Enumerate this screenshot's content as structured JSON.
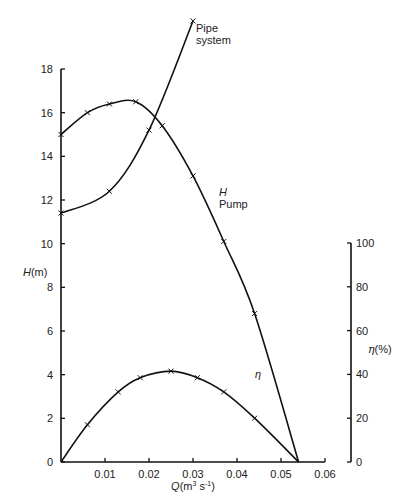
{
  "chart_data": {
    "type": "line",
    "title": "",
    "xlabel": "Q(m³ s⁻¹)",
    "ylabel": "H(m)",
    "y2label": "η(%)",
    "xlim": [
      0,
      0.06
    ],
    "ylim": [
      0,
      18
    ],
    "y2lim": [
      0,
      100
    ],
    "x_ticks": [
      "0.01",
      "0.02",
      "0.03",
      "0.04",
      "0.05",
      "0.06"
    ],
    "y_ticks": [
      "0",
      "2",
      "4",
      "6",
      "8",
      "10",
      "12",
      "14",
      "16",
      "18"
    ],
    "y2_ticks": [
      "0",
      "20",
      "40",
      "60",
      "80",
      "100"
    ],
    "grid": false,
    "series": [
      {
        "name": "Pump H",
        "label_line1": "H",
        "label_line2": "Pump",
        "axis": "left",
        "x": [
          0,
          0.006,
          0.011,
          0.017,
          0.023,
          0.03,
          0.037,
          0.044,
          0.054
        ],
        "values": [
          15.0,
          16.0,
          16.4,
          16.5,
          15.4,
          13.1,
          10.1,
          6.8,
          0
        ]
      },
      {
        "name": "Pipe system",
        "label_line1": "Pipe",
        "label_line2": "system",
        "axis": "left",
        "x": [
          0,
          0.011,
          0.02,
          0.03
        ],
        "values": [
          11.4,
          12.4,
          15.2,
          20.2
        ]
      },
      {
        "name": "η",
        "label_line1": "η",
        "axis": "right",
        "x": [
          0,
          0.006,
          0.013,
          0.018,
          0.025,
          0.031,
          0.037,
          0.044,
          0.054
        ],
        "values": [
          0,
          17,
          32,
          38.5,
          41.5,
          38.5,
          32,
          20,
          0
        ]
      }
    ]
  }
}
